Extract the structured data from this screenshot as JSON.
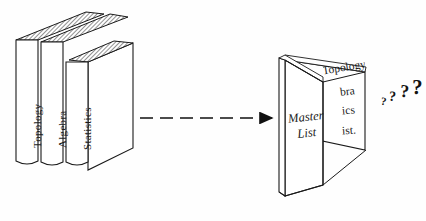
{
  "figure": {
    "background_color": "#fefefe",
    "ink_color": "#1a1a1a"
  },
  "closed_books": {
    "count": 3,
    "spines": [
      {
        "label": "Topology"
      },
      {
        "label": "Algebra"
      },
      {
        "label": "Statistics"
      }
    ],
    "top_edge_fill": "hatched-grey"
  },
  "arrow": {
    "name": "dashed-arrow",
    "style": "dashed",
    "direction": "right",
    "dash_count": 6
  },
  "open_book": {
    "left_page": {
      "line1": "Master",
      "line2": "List"
    },
    "right_page": {
      "lines": [
        {
          "text": "Topology"
        },
        {
          "text": "bra"
        },
        {
          "text": "ics"
        },
        {
          "text": "ist."
        }
      ]
    }
  },
  "question_marks": [
    {
      "glyph": "?",
      "size": 11
    },
    {
      "glyph": "?",
      "size": 14
    },
    {
      "glyph": "?",
      "size": 18
    },
    {
      "glyph": "?",
      "size": 21
    }
  ]
}
